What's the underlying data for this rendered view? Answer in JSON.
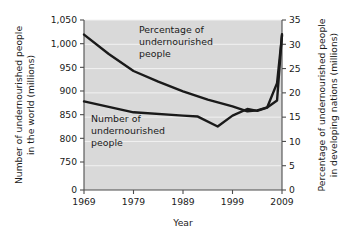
{
  "chart_data": {
    "type": "line",
    "title": "",
    "xlabel": "Year",
    "ylabel": "Number of undernourished people in the world (millions)",
    "y2label": "Percentage of undernourished people in developing nations (millions)",
    "x": [
      1969,
      1979,
      1989,
      1999,
      2009
    ],
    "xlim": [
      1969,
      2009
    ],
    "xticks": [
      "1969",
      "1979",
      "1989",
      "1999",
      "2009"
    ],
    "yticks": [
      "0",
      "750",
      "800",
      "850",
      "900",
      "950",
      "1,000",
      "1,050"
    ],
    "ylim": [
      750,
      1050
    ],
    "y2ticks": [
      "0",
      "5",
      "10",
      "15",
      "20",
      "25",
      "30",
      "35"
    ],
    "y2lim": [
      0,
      35
    ],
    "grid": true,
    "legend_position": "inline-annotations",
    "series": [
      {
        "name": "Percentage of undernourished people",
        "axis": "right",
        "units": "percent",
        "x": [
          1969,
          1974,
          1979,
          1984,
          1989,
          1994,
          1999,
          2002,
          2004,
          2006,
          2008,
          2009
        ],
        "values": [
          32.0,
          28.0,
          24.5,
          22.3,
          20.3,
          18.6,
          17.2,
          16.2,
          16.4,
          17.0,
          22.0,
          31.8
        ]
      },
      {
        "name": "Number of undernourished people",
        "axis": "left",
        "units": "millions",
        "x": [
          1969,
          1979,
          1989,
          1992,
          1996,
          1999,
          2002,
          2004,
          2006,
          2008,
          2009
        ],
        "values": [
          878,
          855,
          848,
          846,
          825,
          848,
          862,
          858,
          865,
          880,
          1020
        ]
      }
    ],
    "annotations": [
      {
        "text_lines": [
          "Percentage of",
          "undernourished",
          "people"
        ],
        "x": 1978,
        "y_frac": 0.12
      },
      {
        "text_lines": [
          "Number of",
          "undernourished",
          "people"
        ],
        "x": 1971,
        "y_frac": 0.56
      }
    ]
  },
  "axes": {
    "left_title_lines": [
      "Number of undernourished people",
      "in the world (millions)"
    ],
    "right_title_lines": [
      "Percentage of undernourished people",
      "in developing nations (millions)"
    ],
    "x_title": "Year"
  },
  "colors": {
    "plot_background": "#d9d9d9",
    "gridline": "#f2f2f2",
    "line": "#1a1a1a",
    "axis": "#4d4d4d",
    "text": "#1a1a1a",
    "page_background": "#ffffff"
  }
}
